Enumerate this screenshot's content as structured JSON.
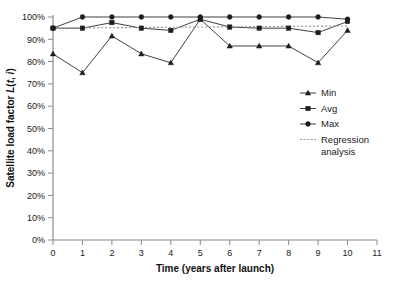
{
  "chart_data": {
    "type": "line",
    "title": "",
    "xlabel": "Time (years after launch)",
    "ylabel": "Satellite load factor L(t, i)",
    "ylabel_main": "Satellite load factor ",
    "ylabel_italic_l": "L",
    "ylabel_paren": "(",
    "ylabel_italic_t": "t",
    "ylabel_comma": ", ",
    "ylabel_italic_i": "i",
    "ylabel_close": ")",
    "x": [
      0,
      1,
      2,
      3,
      4,
      5,
      6,
      7,
      8,
      9,
      10
    ],
    "xlim": [
      0,
      11
    ],
    "ylim": [
      0,
      100
    ],
    "grid": false,
    "legend_position": "right-middle",
    "xticks": [
      "0",
      "1",
      "2",
      "3",
      "4",
      "5",
      "6",
      "7",
      "8",
      "9",
      "10",
      "11"
    ],
    "xtick_values": [
      0,
      1,
      2,
      3,
      4,
      5,
      6,
      7,
      8,
      9,
      10,
      11
    ],
    "yticks": [
      "0%",
      "10%",
      "20%",
      "30%",
      "40%",
      "50%",
      "60%",
      "70%",
      "80%",
      "90%",
      "100%"
    ],
    "ytick_values": [
      0,
      10,
      20,
      30,
      40,
      50,
      60,
      70,
      80,
      90,
      100
    ],
    "series": [
      {
        "name": "Min",
        "marker": "triangle",
        "color": "#2b2b2b",
        "values": [
          83.5,
          75.0,
          91.5,
          83.5,
          79.5,
          99.0,
          87.0,
          87.0,
          87.0,
          79.5,
          94.0
        ]
      },
      {
        "name": "Avg",
        "marker": "square",
        "color": "#2b2b2b",
        "values": [
          95.0,
          95.0,
          97.5,
          95.0,
          94.0,
          99.0,
          95.5,
          95.0,
          95.0,
          93.0,
          98.0
        ]
      },
      {
        "name": "Max",
        "marker": "circle",
        "color": "#2b2b2b",
        "values": [
          95.0,
          100.0,
          100.0,
          100.0,
          100.0,
          100.0,
          100.0,
          100.0,
          100.0,
          100.0,
          99.0
        ]
      },
      {
        "name": "Regression analysis",
        "marker": "none",
        "style": "dotted",
        "color": "#9a9a9a",
        "values": [
          95.0,
          95.1,
          95.2,
          95.3,
          95.4,
          95.5,
          95.6,
          95.7,
          95.8,
          95.9,
          96.0
        ]
      }
    ],
    "legend": [
      {
        "label": "Min",
        "marker": "triangle"
      },
      {
        "label": "Avg",
        "marker": "square"
      },
      {
        "label": "Max",
        "marker": "circle"
      },
      {
        "label": "Regression",
        "label2": "analysis",
        "marker": "dotted-line"
      }
    ]
  }
}
